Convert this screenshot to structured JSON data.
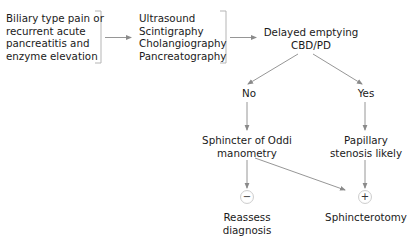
{
  "diagram": {
    "type": "flowchart",
    "nodes": {
      "presentation": {
        "lines": [
          "Biliary type pain or",
          "recurrent acute",
          "pancreatitis and",
          "enzyme elevation"
        ]
      },
      "investigations": {
        "lines": [
          "Ultrasound",
          "Scintigraphy",
          "Cholangiography",
          "Pancreatography"
        ]
      },
      "delayed_emptying": {
        "lines": [
          "Delayed emptying",
          "CBD/PD"
        ]
      },
      "no": {
        "label": "No"
      },
      "yes": {
        "label": "Yes"
      },
      "manometry": {
        "lines": [
          "Sphincter of Oddi",
          "manometry"
        ]
      },
      "papillary": {
        "lines": [
          "Papillary",
          "stenosis likely"
        ]
      },
      "negative": {
        "symbol": "−"
      },
      "positive": {
        "symbol": "+"
      },
      "reassess": {
        "lines": [
          "Reassess",
          "diagnosis"
        ]
      },
      "sphincterotomy": {
        "label": "Sphincterotomy"
      }
    },
    "edges": [
      [
        "presentation",
        "investigations"
      ],
      [
        "investigations",
        "delayed_emptying"
      ],
      [
        "delayed_emptying",
        "no"
      ],
      [
        "delayed_emptying",
        "yes"
      ],
      [
        "no",
        "manometry"
      ],
      [
        "yes",
        "papillary"
      ],
      [
        "manometry",
        "negative"
      ],
      [
        "manometry",
        "positive"
      ],
      [
        "papillary",
        "positive"
      ]
    ],
    "colors": {
      "line": "#8a8a8a",
      "bracket": "#b5b5b5",
      "text": "#1a1a1a"
    }
  }
}
